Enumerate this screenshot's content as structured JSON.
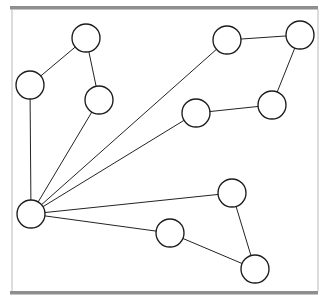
{
  "figure": {
    "type": "graph",
    "width": 331,
    "height": 304,
    "background_color": "#ffffff"
  },
  "style": {
    "node_fill": "#ffffff",
    "node_stroke": "#1b1b1b",
    "node_stroke_width": 1.35,
    "node_radius": 14,
    "edge_color": "#232323",
    "edge_width": 1,
    "frame_bar_color": "#8e8e8e",
    "frame_rule_color": "#b9b9b9"
  },
  "frame": {
    "top_bar": {
      "x": 10,
      "y": 6,
      "width": 308,
      "height": 3.5
    },
    "bottom_bar": {
      "x": 10,
      "y": 291,
      "width": 308,
      "height": 3.5
    },
    "left_rule": {
      "x1": 12,
      "y1": 9,
      "x2": 12,
      "y2": 291
    },
    "right_rule": {
      "x1": 318,
      "y1": 9,
      "x2": 318,
      "y2": 291
    }
  },
  "graph_data": {
    "type": "graph",
    "directed": false,
    "node_count": 11,
    "edge_count": 12,
    "nodes": [
      {
        "id": "n1",
        "label": "",
        "x": 31,
        "y": 214,
        "r": 14,
        "degree": 6
      },
      {
        "id": "n2",
        "label": "",
        "x": 30,
        "y": 85,
        "r": 14,
        "degree": 2
      },
      {
        "id": "n3",
        "label": "",
        "x": 86,
        "y": 38,
        "r": 14,
        "degree": 2
      },
      {
        "id": "n4",
        "label": "",
        "x": 99,
        "y": 100,
        "r": 14,
        "degree": 2
      },
      {
        "id": "n5",
        "label": "",
        "x": 227,
        "y": 40,
        "r": 14,
        "degree": 2
      },
      {
        "id": "n6",
        "label": "",
        "x": 300,
        "y": 35,
        "r": 14,
        "degree": 2
      },
      {
        "id": "n7",
        "label": "",
        "x": 196,
        "y": 113,
        "r": 14,
        "degree": 2
      },
      {
        "id": "n8",
        "label": "",
        "x": 272,
        "y": 105,
        "r": 14,
        "degree": 2
      },
      {
        "id": "n9",
        "label": "",
        "x": 232,
        "y": 193,
        "r": 14,
        "degree": 2
      },
      {
        "id": "n10",
        "label": "",
        "x": 170,
        "y": 233,
        "r": 14,
        "degree": 2
      },
      {
        "id": "n11",
        "label": "",
        "x": 255,
        "y": 269,
        "r": 14,
        "degree": 2
      }
    ],
    "edges": [
      {
        "source": "n1",
        "target": "n2"
      },
      {
        "source": "n1",
        "target": "n4"
      },
      {
        "source": "n1",
        "target": "n5"
      },
      {
        "source": "n1",
        "target": "n7"
      },
      {
        "source": "n1",
        "target": "n9"
      },
      {
        "source": "n1",
        "target": "n10"
      },
      {
        "source": "n2",
        "target": "n3"
      },
      {
        "source": "n3",
        "target": "n4"
      },
      {
        "source": "n5",
        "target": "n6"
      },
      {
        "source": "n6",
        "target": "n8"
      },
      {
        "source": "n7",
        "target": "n8"
      },
      {
        "source": "n9",
        "target": "n11"
      },
      {
        "source": "n10",
        "target": "n11"
      }
    ]
  }
}
